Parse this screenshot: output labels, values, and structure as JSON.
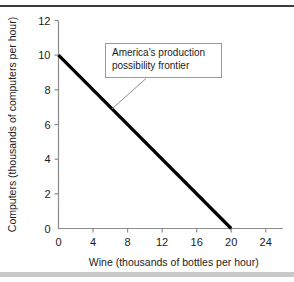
{
  "figure": {
    "width": 294,
    "height": 282,
    "background": "#ffffff",
    "top_rule_color": "#3a3a3a",
    "bottom_bar_color": "#c9c9c9"
  },
  "annotation": {
    "text": "America's production\npossibility frontier",
    "border_color": "#9a9a9a",
    "leader_color": "#8c8c8c"
  },
  "chart_data": {
    "type": "line",
    "title": "",
    "subtitle": "",
    "xlabel": "Wine (thousands of bottles per hour)",
    "ylabel": "Computers (thousands of computers per hour)",
    "xlim": [
      0,
      26
    ],
    "ylim": [
      0,
      12
    ],
    "xticks": [
      0,
      4,
      8,
      12,
      16,
      20,
      24
    ],
    "xtick_labels": [
      "0",
      "4",
      "8",
      "12",
      "16",
      "20",
      "24"
    ],
    "yticks": [
      0,
      2,
      4,
      6,
      8,
      10,
      12
    ],
    "ytick_labels": [
      "0",
      "2",
      "4",
      "6",
      "8",
      "10",
      "12"
    ],
    "grid": false,
    "legend": "none",
    "line_color": "#000000",
    "axis_color": "#8c8c8c",
    "series": [
      {
        "name": "America's production possibility frontier",
        "x": [
          0,
          20
        ],
        "y": [
          10,
          0
        ],
        "points": [
          {
            "x": 0,
            "y": 10
          },
          {
            "x": 20,
            "y": 0
          }
        ]
      }
    ],
    "annotations": [
      {
        "text": "America's production possibility frontier",
        "target_x": 6.2,
        "target_y": 6.9
      }
    ]
  }
}
